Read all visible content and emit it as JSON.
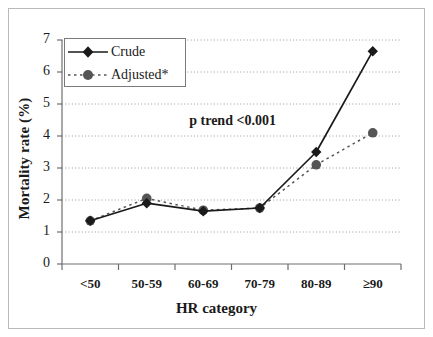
{
  "chart_data": {
    "type": "line",
    "title": "",
    "xlabel": "HR category",
    "ylabel": "Mortality rate (%)",
    "categories": [
      "<50",
      "50-59",
      "60-69",
      "70-79",
      "80-89",
      "≥90"
    ],
    "series": [
      {
        "name": "Crude",
        "values": [
          1.35,
          1.9,
          1.65,
          1.75,
          3.5,
          6.65
        ],
        "marker": "diamond",
        "line_style": "solid",
        "color": "#1a1a1a"
      },
      {
        "name": "Adjusted*",
        "values": [
          1.35,
          2.05,
          1.68,
          1.75,
          3.1,
          4.1
        ],
        "marker": "circle",
        "line_style": "dashed",
        "color": "#555555"
      }
    ],
    "ylim": [
      0,
      7
    ],
    "ytick_labels": [
      "0",
      "1",
      "2",
      "3",
      "4",
      "5",
      "6",
      "7"
    ],
    "ytick_values": [
      0,
      1,
      2,
      3,
      4,
      5,
      6,
      7
    ],
    "grid": "horizontal-dotted",
    "legend_position": "upper-left",
    "annotations": [
      {
        "text": "p trend <0.001",
        "x_category": "60-69",
        "y_value": 4.45
      }
    ]
  },
  "legend": {
    "entries": [
      {
        "label": "Crude"
      },
      {
        "label": "Adjusted*"
      }
    ]
  },
  "colors": {
    "crude": "#1a1a1a",
    "adjusted": "#555555",
    "grid": "#9a9a9a",
    "axis": "#6e6e6e",
    "frame": "#b9b9b9",
    "background": "#ffffff"
  }
}
